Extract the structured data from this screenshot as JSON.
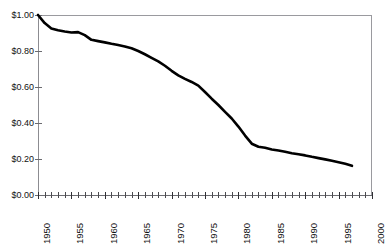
{
  "chart_data": {
    "type": "line",
    "title": "",
    "title_note": "title is cropped off the top edge of the screenshot and is not legible",
    "xlabel": "",
    "ylabel": "",
    "xlim": [
      1950,
      2000
    ],
    "ylim": [
      0.0,
      1.0
    ],
    "y_tick_labels": [
      "$0.00",
      "$0.20",
      "$0.40",
      "$0.60",
      "$0.80",
      "$1.00"
    ],
    "y_tick_values": [
      0.0,
      0.2,
      0.4,
      0.6,
      0.8,
      1.0
    ],
    "x_tick_labels": [
      "1950",
      "1955",
      "1960",
      "1965",
      "1970",
      "1975",
      "1980",
      "1985",
      "1990",
      "1995",
      "2000"
    ],
    "x_tick_values": [
      1950,
      1955,
      1960,
      1965,
      1970,
      1975,
      1980,
      1985,
      1990,
      1995,
      2000
    ],
    "x_minor_tick_interval": 1,
    "grid": false,
    "legend": false,
    "line_color": "#000000",
    "line_width_px": 2.6,
    "axis_color": "#8c8c91",
    "series": [
      {
        "name": "value",
        "x": [
          1950,
          1951,
          1952,
          1953,
          1954,
          1955,
          1956,
          1957,
          1958,
          1959,
          1960,
          1961,
          1962,
          1963,
          1964,
          1965,
          1966,
          1967,
          1968,
          1969,
          1970,
          1971,
          1972,
          1973,
          1974,
          1975,
          1976,
          1977,
          1978,
          1979,
          1980,
          1981,
          1982,
          1983,
          1984,
          1985,
          1986,
          1987,
          1988,
          1989,
          1990,
          1991,
          1992,
          1993,
          1994,
          1995,
          1996,
          1997
        ],
        "values": [
          1.0,
          0.955,
          0.925,
          0.915,
          0.908,
          0.903,
          0.905,
          0.888,
          0.862,
          0.855,
          0.848,
          0.84,
          0.833,
          0.825,
          0.815,
          0.8,
          0.782,
          0.762,
          0.742,
          0.718,
          0.69,
          0.665,
          0.645,
          0.628,
          0.608,
          0.572,
          0.535,
          0.5,
          0.462,
          0.425,
          0.38,
          0.33,
          0.285,
          0.268,
          0.262,
          0.253,
          0.247,
          0.24,
          0.232,
          0.226,
          0.22,
          0.212,
          0.205,
          0.198,
          0.19,
          0.182,
          0.173,
          0.162
        ]
      }
    ]
  },
  "axes": {
    "y_labels": [
      "$1.00",
      "$0.80",
      "$0.60",
      "$0.40",
      "$0.20",
      "$0.00"
    ],
    "x_labels": [
      "1950",
      "1955",
      "1960",
      "1965",
      "1970",
      "1975",
      "1980",
      "1985",
      "1990",
      "1995",
      "2000"
    ]
  }
}
